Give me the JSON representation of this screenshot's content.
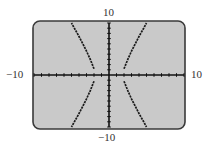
{
  "labels": {
    "y_max": "10",
    "y_min": "−10",
    "x_min": "−10",
    "x_max": "10"
  },
  "colors": {
    "screen_bg": "#c9c9c9",
    "screen_border": "#3a3a3a",
    "curve": "#1a1a1a",
    "axis": "#111111"
  },
  "chart_data": {
    "type": "line",
    "title": "",
    "xlabel": "",
    "ylabel": "",
    "xlim": [
      -10,
      10
    ],
    "ylim": [
      -10,
      10
    ],
    "x_tick_spacing": 1,
    "y_tick_spacing": 1,
    "grid": false,
    "series": [
      {
        "name": "upper-right branch",
        "x": [
          2.0,
          2.5,
          3.0,
          3.5,
          4.0,
          4.5,
          5.0
        ],
        "y": [
          1.2,
          3.0,
          4.6,
          6.0,
          7.4,
          8.7,
          10.0
        ]
      },
      {
        "name": "lower-right branch",
        "x": [
          2.0,
          2.5,
          3.0,
          3.5,
          4.0,
          4.5,
          5.0
        ],
        "y": [
          -1.2,
          -3.0,
          -4.6,
          -6.0,
          -7.4,
          -8.7,
          -10.0
        ]
      },
      {
        "name": "upper-left branch",
        "x": [
          -2.0,
          -2.5,
          -3.0,
          -3.5,
          -4.0,
          -4.5,
          -5.0
        ],
        "y": [
          1.2,
          3.0,
          4.6,
          6.0,
          7.4,
          8.7,
          10.0
        ]
      },
      {
        "name": "lower-left branch",
        "x": [
          -2.0,
          -2.5,
          -3.0,
          -3.5,
          -4.0,
          -4.5,
          -5.0
        ],
        "y": [
          -1.2,
          -3.0,
          -4.6,
          -6.0,
          -7.4,
          -8.7,
          -10.0
        ]
      }
    ]
  }
}
